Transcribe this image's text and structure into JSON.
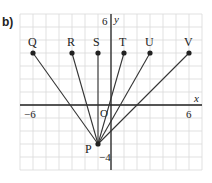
{
  "part_label": "b)",
  "axes": {
    "x_label": "x",
    "y_label": "y",
    "origin_label": "O",
    "x_range": [
      -7,
      7
    ],
    "y_range": [
      -5,
      7
    ],
    "x_ticks_labeled": [
      {
        "value": -6,
        "label": "−6"
      },
      {
        "value": 6,
        "label": "6"
      }
    ],
    "y_ticks_labeled": [
      {
        "value": 6,
        "label": "6"
      },
      {
        "value": -4,
        "label": "−4"
      }
    ],
    "grid": true
  },
  "points": [
    {
      "name": "Q",
      "x": -6,
      "y": 4
    },
    {
      "name": "R",
      "x": -3,
      "y": 4
    },
    {
      "name": "S",
      "x": -1,
      "y": 4
    },
    {
      "name": "T",
      "x": 1,
      "y": 4
    },
    {
      "name": "U",
      "x": 3,
      "y": 4
    },
    {
      "name": "V",
      "x": 6,
      "y": 4
    },
    {
      "name": "P",
      "x": -1,
      "y": -3
    }
  ],
  "segments": [
    {
      "from": "P",
      "to": "Q"
    },
    {
      "from": "P",
      "to": "R"
    },
    {
      "from": "P",
      "to": "S"
    },
    {
      "from": "P",
      "to": "T"
    },
    {
      "from": "P",
      "to": "U"
    },
    {
      "from": "P",
      "to": "V"
    }
  ],
  "colors": {
    "grid": "#d9d9d9",
    "axis": "#222222",
    "line": "#333333",
    "point": "#222222"
  }
}
